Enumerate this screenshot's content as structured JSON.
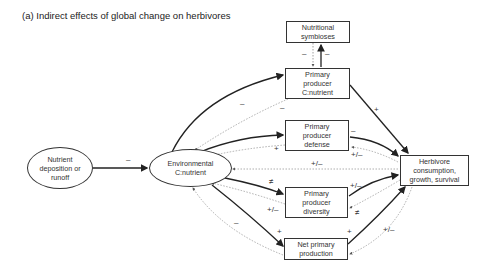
{
  "title": "(a) Indirect effects of global change on herbivores",
  "nodes": {
    "nutrient": "Nutrient\ndeposition or\nrunoff",
    "environmental": "Environmental\nC:nutrient",
    "symbioses": "Nutritional\nsymbioses",
    "pp_cn": "Primary\nproducer\nC:nutrient",
    "pp_defense": "Primary\nproducer\ndefense",
    "pp_diversity": "Primary\nproducer\ndiversity",
    "npp": "Net primary\nproduction",
    "herbivore": "Herbivore\nconsumption,\ngrowth, survival"
  },
  "edge_labels": {
    "nutrient_env": "–",
    "sym_down": "–",
    "sym_up": "–",
    "env_cn": "–",
    "cn_env": "–",
    "cn_herb": "+",
    "env_def": "+",
    "def_herb": "–",
    "herb_def": "+/–",
    "env_herb": "+/–",
    "env_div": "≠",
    "div_env": "+/–",
    "div_herb": "+/–",
    "herb_div": "≠",
    "env_npp": "+",
    "npp_env": "–",
    "npp_herb": "+",
    "herb_env": "+/–"
  },
  "legend": {
    "solid_line": "direct effect (solid)",
    "dotted_line": "feedback (dotted)"
  }
}
